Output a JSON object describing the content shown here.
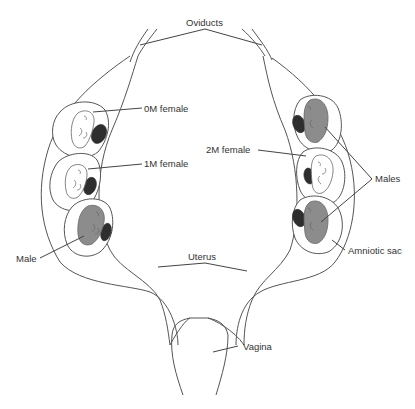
{
  "diagram": {
    "labels": {
      "oviducts": "Oviducts",
      "female_0m": "0M female",
      "female_1m": "1M female",
      "female_2m": "2M female",
      "male_left": "Male",
      "males_right": "Males",
      "uterus": "Uterus",
      "amniotic_sac": "Amniotic sac",
      "vagina": "Vagina"
    },
    "left_horn": {
      "fetuses": [
        {
          "position": 1,
          "sex": "female",
          "label": "0M female"
        },
        {
          "position": 2,
          "sex": "female",
          "label": "1M female"
        },
        {
          "position": 3,
          "sex": "male",
          "label": "Male"
        }
      ]
    },
    "right_horn": {
      "fetuses": [
        {
          "position": 1,
          "sex": "male",
          "label": "Males"
        },
        {
          "position": 2,
          "sex": "female",
          "label": "2M female"
        },
        {
          "position": 3,
          "sex": "male",
          "label": "Males"
        }
      ]
    },
    "colors": {
      "male_fetus": "#8c8c8c",
      "female_fetus": "#ffffff",
      "placenta": "#2e2e2e",
      "outline": "#555555"
    }
  }
}
